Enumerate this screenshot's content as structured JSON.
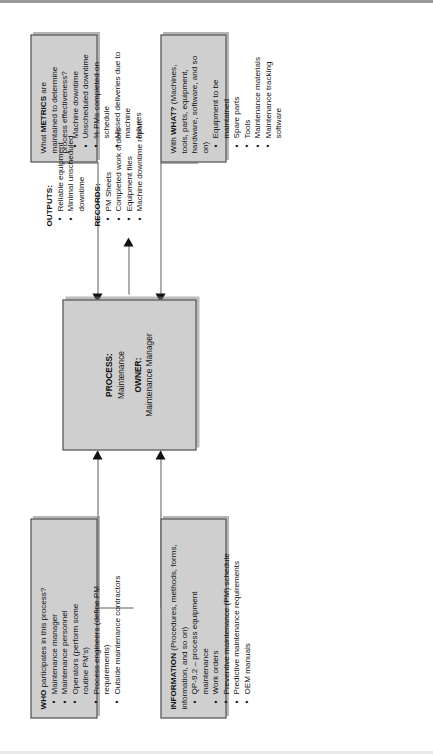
{
  "diagram": {
    "type": "process-flow-diagram",
    "orientation": "rotated-90-ccw",
    "colors": {
      "box_fill": "#cfcfcf",
      "box_border": "#3a3a3a",
      "connector": "#5d5d5d",
      "arrowhead": "#111111",
      "page_background": "#ffffff"
    },
    "process": {
      "process_label": "PROCESS:",
      "process_value": "Maintenance",
      "owner_label": "OWNER:",
      "owner_value": "Maintenance Manager"
    },
    "who": {
      "heading_bold": "WHO",
      "heading_rest": " participates in this process?",
      "items": [
        {
          "text": "Maintenance manager",
          "sub": false
        },
        {
          "text": "Maintenance personnel",
          "sub": false
        },
        {
          "text": "Operators (perform some",
          "sub": false
        },
        {
          "text": "routine PM's)",
          "sub": true
        },
        {
          "text": "Process engineers (define PM",
          "sub": false
        },
        {
          "text": "requirements)",
          "sub": true
        },
        {
          "text": "Outside maintenance contractors",
          "sub": false
        }
      ]
    },
    "information": {
      "heading_bold": "INFORMATION",
      "heading_rest": " (Procedures, methods, forms, information, and so on)",
      "items": [
        {
          "text": "QP-9.2 – process equipment",
          "sub": false
        },
        {
          "text": "maintenance",
          "sub": true
        },
        {
          "text": "Work orders",
          "sub": false
        },
        {
          "text": "Preventive maintenance (PM) schedule",
          "sub": false
        },
        {
          "text": "Predictive maintenance requirements",
          "sub": false
        },
        {
          "text": "OEM manuals",
          "sub": false
        }
      ]
    },
    "with_what": {
      "heading_pre": "With ",
      "heading_bold": "WHAT?",
      "heading_rest": " (Machines, tools, parts, equipment, hardware, software, and so on)",
      "items": [
        {
          "text": "Equipment to be maintained",
          "sub": false
        },
        {
          "text": "Spare parts",
          "sub": false
        },
        {
          "text": "Tools",
          "sub": false
        },
        {
          "text": "Maintenance materials",
          "sub": false
        },
        {
          "text": "Maintenance tracking software",
          "sub": false
        }
      ]
    },
    "metrics": {
      "heading_pre": "What ",
      "heading_bold": "METRICS",
      "heading_rest": " are maintained to determine process effectiveness?",
      "items": [
        {
          "text": "Machine downtime",
          "sub": false
        },
        {
          "text": "Unscheduled downtime",
          "sub": false
        },
        {
          "text": "% PMs completed on schedule",
          "sub": false
        },
        {
          "text": "Missed deliveries due to machine",
          "sub": false
        },
        {
          "text": "failures",
          "sub": true
        }
      ]
    },
    "outputs": {
      "heading": "OUTPUTS:",
      "items": [
        "Reliable equipment",
        "Minimal unscheduled downtime"
      ]
    },
    "records": {
      "heading": "RECORDS:",
      "items": [
        "PM Sheets",
        "Completed work orders",
        "Equipment files",
        "Machine downtime report"
      ]
    }
  }
}
